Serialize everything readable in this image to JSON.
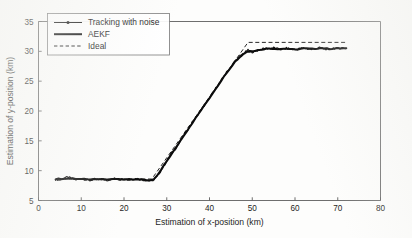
{
  "chart_data": {
    "type": "line",
    "title": "",
    "xlabel": "Estimation of x-position (km)",
    "ylabel": "Estimation of y-position (km)",
    "xlim": [
      0,
      80
    ],
    "ylim": [
      5,
      35
    ],
    "xticks": [
      0,
      10,
      20,
      30,
      40,
      50,
      60,
      70,
      80
    ],
    "yticks": [
      5,
      10,
      15,
      20,
      25,
      30,
      35
    ],
    "xtick_labels": [
      "0",
      "10",
      "20",
      "30",
      "40",
      "50",
      "60",
      "70",
      "80"
    ],
    "ytick_labels": [
      "5",
      "10",
      "15",
      "20",
      "25",
      "30",
      "35"
    ],
    "grid": false,
    "legend_position": "upper left",
    "series": [
      {
        "name": "Tracking with noise",
        "style": "line-with-marker",
        "x": [
          4.0,
          5.0,
          6.0,
          7.0,
          8.0,
          9.0,
          10.0,
          11.0,
          12.0,
          13.0,
          14.0,
          15.0,
          16.0,
          17.0,
          18.0,
          19.0,
          20.0,
          21.0,
          22.0,
          23.0,
          24.0,
          25.0,
          26.0,
          27.0,
          28.0,
          29.0,
          30.0,
          31.0,
          32.0,
          33.0,
          34.0,
          35.0,
          36.0,
          37.0,
          38.0,
          39.0,
          40.0,
          41.0,
          42.0,
          43.0,
          44.0,
          45.0,
          46.0,
          47.0,
          48.0,
          49.0,
          50.0,
          51.0,
          52.0,
          53.0,
          54.0,
          55.0,
          56.0,
          57.0,
          58.0,
          59.0,
          60.0,
          61.0,
          62.0,
          63.0,
          64.0,
          65.0,
          66.0,
          67.0,
          68.0,
          69.0,
          70.0,
          71.0,
          72.0
        ],
        "y": [
          8.55,
          8.45,
          8.8,
          8.9,
          8.6,
          8.45,
          8.7,
          8.5,
          8.35,
          8.55,
          8.45,
          8.6,
          8.4,
          8.55,
          8.7,
          8.5,
          8.65,
          8.45,
          8.55,
          8.7,
          8.5,
          8.4,
          8.3,
          8.45,
          9.3,
          10.4,
          11.6,
          12.9,
          13.6,
          14.8,
          16.0,
          17.0,
          18.1,
          19.1,
          20.2,
          21.1,
          22.2,
          23.3,
          24.4,
          25.4,
          26.5,
          27.4,
          28.4,
          29.1,
          29.7,
          30.2,
          29.9,
          30.1,
          30.3,
          30.5,
          30.45,
          30.6,
          30.4,
          30.3,
          30.5,
          30.4,
          30.25,
          30.45,
          30.55,
          30.4,
          30.3,
          30.5,
          30.6,
          30.4,
          30.35,
          30.55,
          30.45,
          30.6,
          30.5
        ]
      },
      {
        "name": "AEKF",
        "style": "solid-thick",
        "x": [
          4.0,
          6.0,
          8.0,
          10.0,
          12.0,
          14.0,
          16.0,
          18.0,
          20.0,
          22.0,
          24.0,
          26.0,
          27.0,
          28.0,
          30.0,
          32.0,
          34.0,
          36.0,
          38.0,
          40.0,
          42.0,
          44.0,
          46.0,
          48.0,
          49.0,
          50.0,
          52.0,
          54.0,
          56.0,
          58.0,
          60.0,
          62.0,
          64.0,
          66.0,
          68.0,
          70.0,
          72.0
        ],
        "y": [
          8.6,
          8.65,
          8.7,
          8.6,
          8.5,
          8.55,
          8.5,
          8.6,
          8.55,
          8.6,
          8.5,
          8.4,
          8.5,
          9.4,
          11.6,
          13.7,
          15.9,
          18.0,
          20.1,
          22.2,
          24.3,
          26.4,
          28.3,
          29.6,
          30.0,
          30.0,
          30.3,
          30.5,
          30.4,
          30.45,
          30.3,
          30.5,
          30.4,
          30.55,
          30.4,
          30.5,
          30.5
        ]
      },
      {
        "name": "Ideal",
        "style": "dashed",
        "x": [
          4.0,
          26.5,
          49.0,
          72.0
        ],
        "y": [
          8.6,
          8.6,
          31.5,
          31.5
        ]
      }
    ]
  },
  "legend": {
    "entries": [
      {
        "label": "Tracking with noise",
        "sample": "line-marker-sample"
      },
      {
        "label": "AEKF",
        "sample": "solid-line-sample"
      },
      {
        "label": "Ideal",
        "sample": "dashed-line-sample"
      }
    ]
  },
  "colors": {
    "background": "#fdfdfc",
    "axis": "#5d5d5d",
    "series": "#111111"
  }
}
